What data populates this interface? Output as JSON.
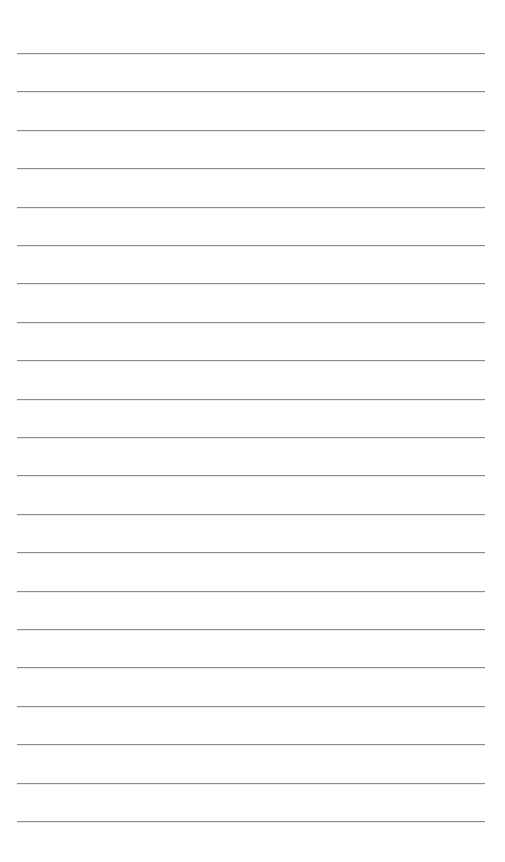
{
  "page": {
    "type": "lined-paper",
    "background_color": "#ffffff",
    "rule_color": "#8c8c8c",
    "rule_count": 21,
    "first_rule_y": 53,
    "rule_spacing": 38.4,
    "rule_left": 17,
    "rule_width": 468
  }
}
